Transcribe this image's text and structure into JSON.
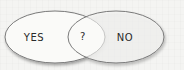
{
  "diagram": {
    "type": "venn",
    "sets": [
      {
        "id": "left",
        "label": "YES"
      },
      {
        "id": "right",
        "label": "NO"
      }
    ],
    "intersection": {
      "label": "?"
    },
    "colors": {
      "background": "#f4f4f2",
      "fill": "#fafaf8",
      "stroke": "#7a7a7a",
      "text": "#2a2a2a"
    }
  }
}
